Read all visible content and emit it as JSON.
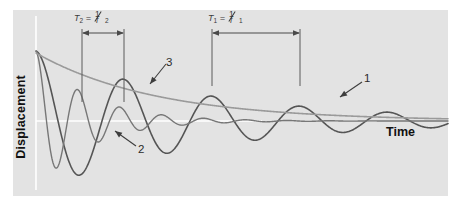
{
  "figure": {
    "kind": "damped-oscillation-diagram",
    "background_color": "#ffffff",
    "panel_color": "#e3e3e3",
    "axis_color": "#ffffff"
  },
  "axes": {
    "ylabel": "Displacement",
    "xlabel": "Time",
    "y_axis_x": 36,
    "baseline_y": 121,
    "baseline_x_end": 262
  },
  "dimensions": [
    {
      "id": "T2",
      "symbol": "T",
      "sub": "2",
      "equals": "=",
      "numerator": "1",
      "denominator": "f",
      "den_sub": "2",
      "text": "T2 = 1/f2",
      "x_start": 82,
      "x_end": 124,
      "arrow_y": 33,
      "tick_bottom": 102
    },
    {
      "id": "T1",
      "symbol": "T",
      "sub": "1",
      "equals": "=",
      "numerator": "1",
      "denominator": "f",
      "den_sub": "1",
      "text": "T1 = 1/f1",
      "x_start": 212,
      "x_end": 300,
      "arrow_y": 33,
      "tick_bottom": 86
    }
  ],
  "callouts": [
    {
      "id": "1",
      "label": "1",
      "text_x": 364,
      "text_y": 72,
      "arrow_from": [
        362,
        82
      ],
      "arrow_to": [
        340,
        97
      ],
      "points_to": "curve-1-low-frequency-oscillation"
    },
    {
      "id": "2",
      "label": "2",
      "text_x": 138,
      "text_y": 143,
      "arrow_from": [
        136,
        146
      ],
      "arrow_to": [
        115,
        131
      ],
      "points_to": "curve-2-high-frequency-oscillation"
    },
    {
      "id": "3",
      "label": "3",
      "text_x": 166,
      "text_y": 56,
      "arrow_from": [
        166,
        64
      ],
      "arrow_to": [
        150,
        84
      ],
      "points_to": "curve-3-decay-envelope"
    }
  ],
  "curves": [
    {
      "id": "curve-1",
      "name": "low-frequency-damped-oscillation",
      "color": "#555555",
      "width": 1.6,
      "origin": [
        36,
        53
      ],
      "amplitude0": 70,
      "decay_tau": 170,
      "period": 88,
      "phase_deg": 90,
      "x_start": 36,
      "x_end": 448
    },
    {
      "id": "curve-2",
      "name": "high-frequency-damped-oscillation",
      "color": "#777777",
      "width": 1.4,
      "origin": [
        36,
        53
      ],
      "amplitude0": 70,
      "decay_tau": 52,
      "period": 42,
      "phase_deg": 90,
      "x_start": 36,
      "x_end": 448
    },
    {
      "id": "curve-3",
      "name": "decay-envelope",
      "color": "#9a9a9a",
      "width": 1.6,
      "origin": [
        36,
        53
      ],
      "amplitude0": 68,
      "decay_tau": 120,
      "x_start": 36,
      "x_end": 448
    }
  ],
  "chart_data": {
    "type": "line",
    "title": "",
    "xlabel": "Time",
    "ylabel": "Displacement",
    "grid": false,
    "legend": "none",
    "annotations": [
      "T2 = 1/f2",
      "T1 = 1/f1",
      "1",
      "2",
      "3"
    ],
    "series": [
      {
        "name": "1",
        "description": "Low-frequency lightly damped oscillation, period T1",
        "color": "#555555",
        "model": "A0*exp(-t/tau)*cos(2*pi*t/T)",
        "A0": 70,
        "tau": 170,
        "T": 88
      },
      {
        "name": "2",
        "description": "High-frequency heavily damped oscillation, period T2",
        "color": "#777777",
        "model": "A0*exp(-t/tau)*cos(2*pi*t/T)",
        "A0": 70,
        "tau": 52,
        "T": 42
      },
      {
        "name": "3",
        "description": "Exponential decay envelope",
        "color": "#9a9a9a",
        "model": "A0*exp(-t/tau)",
        "A0": 68,
        "tau": 120
      }
    ]
  }
}
